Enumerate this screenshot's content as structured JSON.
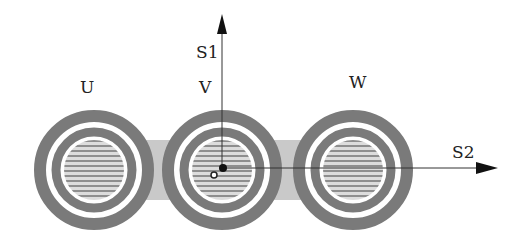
{
  "diagram": {
    "phases": [
      {
        "label": "U",
        "cx": 94,
        "cy": 170
      },
      {
        "label": "V",
        "cx": 222,
        "cy": 170
      },
      {
        "label": "W",
        "cx": 353,
        "cy": 170
      }
    ],
    "axes": {
      "s1_label": "S1",
      "s2_label": "S2"
    },
    "colors": {
      "ring": "#7a7a7a",
      "band": "#c8c8c8",
      "core_fill": "#d6d6d6",
      "core_lines": "#8a8a8a",
      "axis": "#333333"
    }
  }
}
